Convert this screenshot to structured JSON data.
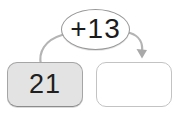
{
  "figure": {
    "operation_label": "+13",
    "input_value": "21",
    "output_value": "",
    "colors": {
      "input_box_fill": "#e3e3e3",
      "input_box_border": "#a5a5a5",
      "answer_box_fill": "#ffffff",
      "answer_box_border": "#c3c3c3",
      "oval_fill": "#ffffff",
      "oval_border": "#979797",
      "arrow": "#b4b4b4",
      "text": "#1b1b1b"
    },
    "icons": {
      "arrow": "curved-arrow-icon"
    }
  }
}
